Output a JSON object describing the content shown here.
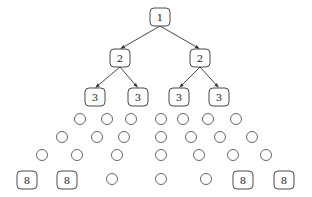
{
  "diagram": {
    "type": "tree",
    "colors": {
      "stroke": "#333333",
      "background": "#ffffff"
    },
    "nodes": [
      {
        "id": "n1",
        "label": "1",
        "shape": "box",
        "x": 160,
        "y": 17
      },
      {
        "id": "n2a",
        "label": "2",
        "shape": "box",
        "x": 120,
        "y": 58
      },
      {
        "id": "n2b",
        "label": "2",
        "shape": "box",
        "x": 200,
        "y": 58
      },
      {
        "id": "n3a",
        "label": "3",
        "shape": "box",
        "x": 95,
        "y": 97
      },
      {
        "id": "n3b",
        "label": "3",
        "shape": "box",
        "x": 138,
        "y": 97
      },
      {
        "id": "n3c",
        "label": "3",
        "shape": "box",
        "x": 179,
        "y": 97
      },
      {
        "id": "n3d",
        "label": "3",
        "shape": "box",
        "x": 219,
        "y": 97
      },
      {
        "id": "n8a",
        "label": "8",
        "shape": "box",
        "x": 27,
        "y": 180
      },
      {
        "id": "n8b",
        "label": "8",
        "shape": "box",
        "x": 67,
        "y": 180
      },
      {
        "id": "n8c",
        "label": "8",
        "shape": "box",
        "x": 243,
        "y": 180
      },
      {
        "id": "n8d",
        "label": "8",
        "shape": "box",
        "x": 284,
        "y": 180
      }
    ],
    "edges": [
      {
        "from": "n1",
        "to": "n2a"
      },
      {
        "from": "n1",
        "to": "n2b"
      },
      {
        "from": "n2a",
        "to": "n3a"
      },
      {
        "from": "n2a",
        "to": "n3b"
      },
      {
        "from": "n2b",
        "to": "n3c"
      },
      {
        "from": "n2b",
        "to": "n3d"
      }
    ],
    "circles": [
      {
        "x": 80,
        "y": 119
      },
      {
        "x": 107,
        "y": 119
      },
      {
        "x": 131,
        "y": 119
      },
      {
        "x": 161,
        "y": 119
      },
      {
        "x": 183,
        "y": 119
      },
      {
        "x": 208,
        "y": 119
      },
      {
        "x": 236,
        "y": 119
      },
      {
        "x": 62,
        "y": 137
      },
      {
        "x": 97,
        "y": 137
      },
      {
        "x": 124,
        "y": 137
      },
      {
        "x": 161,
        "y": 137
      },
      {
        "x": 191,
        "y": 137
      },
      {
        "x": 220,
        "y": 137
      },
      {
        "x": 252,
        "y": 137
      },
      {
        "x": 42,
        "y": 155
      },
      {
        "x": 77,
        "y": 155
      },
      {
        "x": 117,
        "y": 155
      },
      {
        "x": 161,
        "y": 155
      },
      {
        "x": 199,
        "y": 155
      },
      {
        "x": 233,
        "y": 155
      },
      {
        "x": 266,
        "y": 155
      },
      {
        "x": 112,
        "y": 179
      },
      {
        "x": 161,
        "y": 179
      },
      {
        "x": 206,
        "y": 179
      }
    ]
  }
}
